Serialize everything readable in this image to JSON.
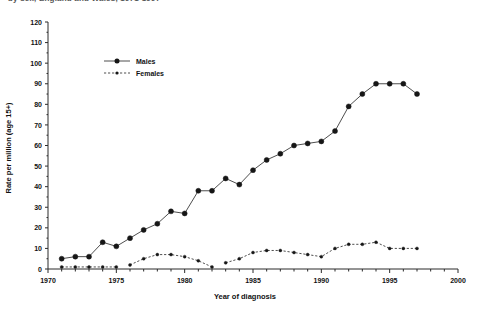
{
  "caption": {
    "text": "by sex, England and Wales, 1971-1997"
  },
  "chart_data": {
    "type": "line",
    "title": "",
    "xlabel": "Year of diagnosis",
    "ylabel": "Rate per million (age 15+)",
    "xlim": [
      1970,
      2000
    ],
    "ylim": [
      0,
      120
    ],
    "xticks": [
      1970,
      1975,
      1980,
      1985,
      1990,
      1995,
      2000
    ],
    "xtick_labels": [
      "1970",
      "1975",
      "1980",
      "1985",
      "1990",
      "1995",
      "2000"
    ],
    "xminor_step": 1,
    "yticks": [
      0,
      10,
      20,
      30,
      40,
      50,
      60,
      70,
      80,
      90,
      100,
      110,
      120
    ],
    "ytick_labels": [
      "0",
      "10",
      "20",
      "30",
      "40",
      "50",
      "60",
      "70",
      "80",
      "90",
      "100",
      "110",
      "120"
    ],
    "grid": false,
    "legend_position": "upper-left-inside",
    "series": [
      {
        "name": "Males",
        "marker": "filled-circle",
        "linestyle": "solid",
        "color": "#161616",
        "x": [
          1971,
          1972,
          1973,
          1974,
          1975,
          1976,
          1977,
          1978,
          1979,
          1980,
          1981,
          1982,
          1983,
          1984,
          1985,
          1986,
          1987,
          1988,
          1989,
          1990,
          1991,
          1992,
          1993,
          1994,
          1995,
          1996,
          1997
        ],
        "values": [
          5,
          6,
          6,
          13,
          11,
          15,
          19,
          22,
          28,
          27,
          38,
          38,
          44,
          41,
          48,
          53,
          56,
          60,
          61,
          62,
          67,
          79,
          85,
          90,
          90,
          90,
          85
        ]
      },
      {
        "name": "Females",
        "marker": "filled-circle-small",
        "linestyle": "dashed",
        "color": "#161616",
        "x": [
          1971,
          1972,
          1973,
          1974,
          1975,
          1976,
          1977,
          1978,
          1979,
          1980,
          1981,
          1982,
          1983,
          1984,
          1985,
          1986,
          1987,
          1988,
          1989,
          1990,
          1991,
          1992,
          1993,
          1994,
          1995,
          1996,
          1997
        ],
        "values": [
          1,
          1,
          1,
          1,
          1,
          2,
          5,
          7,
          7,
          6,
          4,
          1,
          3,
          5,
          8,
          9,
          9,
          8,
          7,
          6,
          10,
          12,
          12,
          13,
          10,
          10,
          10
        ]
      }
    ],
    "legend_entries": [
      "Males",
      "Females"
    ]
  },
  "legend": {
    "males_label": "Males",
    "females_label": "Females"
  }
}
